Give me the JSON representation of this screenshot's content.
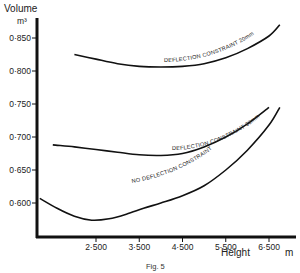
{
  "chart_data": {
    "type": "line",
    "title": "",
    "caption": "Fig. 5",
    "xlabel": "Height",
    "xunit": "m",
    "ylabel": "Volume",
    "yunit": "m³",
    "xlim": [
      1.0,
      7.0
    ],
    "ylim": [
      0.55,
      0.88
    ],
    "grid": false,
    "legend": "inline curve labels",
    "x_ticks": [
      "2·500",
      "3·500",
      "4·500",
      "5·500",
      "6·500"
    ],
    "x_tick_values": [
      2.5,
      3.5,
      4.5,
      5.5,
      6.5
    ],
    "y_ticks": [
      "0·600",
      "0·650",
      "0·700",
      "0·750",
      "0·800",
      "0·850"
    ],
    "y_tick_values": [
      0.6,
      0.65,
      0.7,
      0.75,
      0.8,
      0.85
    ],
    "series": [
      {
        "name": "DEFLECTION CONSTRAINT 20mm",
        "x": [
          2.0,
          2.5,
          3.0,
          3.5,
          4.0,
          4.5,
          5.0,
          5.5,
          6.0,
          6.5,
          6.75
        ],
        "y": [
          0.825,
          0.818,
          0.811,
          0.807,
          0.806,
          0.807,
          0.811,
          0.82,
          0.834,
          0.853,
          0.87
        ]
      },
      {
        "name": "DEFLECTION CONSTRAINT 30mm",
        "x": [
          1.5,
          2.0,
          2.5,
          3.0,
          3.5,
          4.0,
          4.5,
          5.0,
          5.5,
          6.0,
          6.5
        ],
        "y": [
          0.688,
          0.685,
          0.681,
          0.677,
          0.673,
          0.672,
          0.675,
          0.685,
          0.7,
          0.72,
          0.745
        ]
      },
      {
        "name": "NO DEFLECTION CONSTRAINT",
        "x": [
          1.2,
          1.6,
          2.0,
          2.4,
          2.8,
          3.2,
          3.6,
          4.0,
          4.5,
          5.0,
          5.5,
          6.0,
          6.5,
          6.75
        ],
        "y": [
          0.607,
          0.592,
          0.58,
          0.574,
          0.576,
          0.583,
          0.592,
          0.6,
          0.611,
          0.626,
          0.65,
          0.68,
          0.718,
          0.745
        ]
      }
    ]
  },
  "labels": {
    "y_title": "Volume",
    "y_unit": "m³",
    "x_title": "Height",
    "x_unit": "m",
    "caption": "Fig. 5",
    "curve_20": "DEFLECTION CONSTRAINT 20mm",
    "curve_30": "DEFLECTION CONSTRAINT 30mm",
    "curve_none": "NO DEFLECTION CONSTRAINT"
  }
}
